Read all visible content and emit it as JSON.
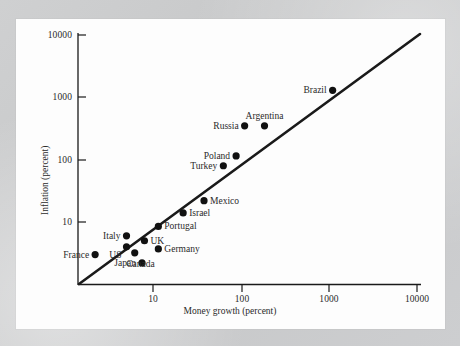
{
  "figure": {
    "background_color": "#c9cacb",
    "card_color": "#fdfdfd",
    "ink_color": "#111111"
  },
  "chart_data": {
    "type": "scatter",
    "title": "",
    "xlabel": "Money growth (percent)",
    "ylabel": "Inflation (percent)",
    "xscale": "log",
    "yscale": "log",
    "xlim": [
      1.4,
      10000
    ],
    "ylim": [
      1.0,
      10000
    ],
    "xticks": [
      "10",
      "100",
      "1000",
      "10000"
    ],
    "xtick_values": [
      10,
      100,
      1000,
      10000
    ],
    "yticks": [
      "10",
      "100",
      "1000",
      "10000"
    ],
    "ytick_values": [
      10,
      100,
      1000,
      10000
    ],
    "grid": false,
    "legend": "none",
    "reference_line": {
      "label": "45-degree line",
      "from": [
        1.45,
        1.0
      ],
      "to": [
        10000,
        10000
      ]
    },
    "points": [
      {
        "label": "Brazil",
        "x": 1100,
        "y": 1300,
        "label_side": "left"
      },
      {
        "label": "Argentina",
        "x": 185,
        "y": 350,
        "label_side": "above"
      },
      {
        "label": "Russia",
        "x": 110,
        "y": 350,
        "label_side": "left"
      },
      {
        "label": "Poland",
        "x": 88,
        "y": 115,
        "label_side": "left"
      },
      {
        "label": "Turkey",
        "x": 63,
        "y": 80,
        "label_side": "left"
      },
      {
        "label": "Mexico",
        "x": 38,
        "y": 22,
        "label_side": "right"
      },
      {
        "label": "Israel",
        "x": 22,
        "y": 14,
        "label_side": "right"
      },
      {
        "label": "Portugal",
        "x": 11.5,
        "y": 8.5,
        "label_side": "right"
      },
      {
        "label": "Italy",
        "x": 5,
        "y": 6,
        "label_side": "left"
      },
      {
        "label": "UK",
        "x": 8,
        "y": 5,
        "label_side": "right"
      },
      {
        "label": "France",
        "x": 2.2,
        "y": 3,
        "label_side": "left"
      },
      {
        "label": "US",
        "x": 5,
        "y": 4,
        "label_side": "below-left"
      },
      {
        "label": "Germany",
        "x": 11.5,
        "y": 3.7,
        "label_side": "right"
      },
      {
        "label": "Canada",
        "x": 6.2,
        "y": 3.2,
        "label_side": "below"
      },
      {
        "label": "Japan",
        "x": 7.5,
        "y": 2.2,
        "label_side": "left"
      }
    ]
  }
}
